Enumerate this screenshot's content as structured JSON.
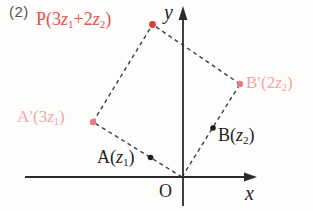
{
  "problem_label": "(2)",
  "colors": {
    "axis": "#2b2b2b",
    "dash": "#3f3f3f",
    "ink": "#232323",
    "gray": "#565656",
    "p_text": "#e85050",
    "p_dot": "#e23c36",
    "pink_text": "#f2a6ab",
    "pink_dot": "#ea7b80",
    "black_dot": "#1c1c1c"
  },
  "axes": {
    "x_label": "x",
    "y_label": "y",
    "origin_label": "O"
  },
  "points": {
    "P": {
      "pre": "P(3",
      "v1": "z",
      "s1": "1",
      "mid": "+2",
      "v2": "z",
      "s2": "2",
      "suf": ")"
    },
    "A_prime": {
      "pre": "A′(3",
      "v1": "z",
      "s1": "1",
      "suf": ")"
    },
    "B_prime": {
      "pre": "B′(2",
      "v1": "z",
      "s1": "2",
      "suf": ")"
    },
    "A": {
      "pre": "A(",
      "v1": "z",
      "s1": "1",
      "suf": ")"
    },
    "B": {
      "pre": "B(",
      "v1": "z",
      "s1": "2",
      "suf": ")"
    }
  }
}
